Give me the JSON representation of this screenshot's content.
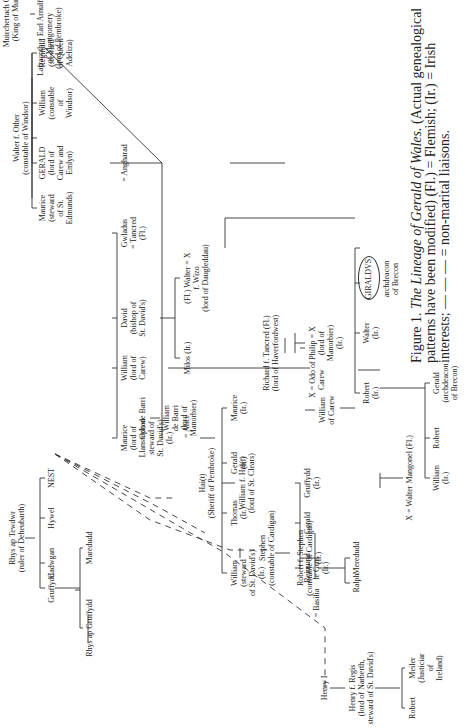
{
  "figure": {
    "caption_label": "Figure 1.",
    "caption_title": "The Lineage of Gerald of Wales.",
    "caption_text": "(Actual genealogical patterns have been modified) (Fl.) = Flemish; (Ir.) = Irish interests; — — — = non-marital liaisons."
  },
  "nodes": {
    "muirchertach": [
      "Muirchertach O Brien",
      "(King of Munster)"
    ],
    "lafracoth": [
      "Lafracoth = Earl Arnulf",
      "of Montgomery",
      "(lord of Pembroke)"
    ],
    "walter_f_other": [
      "Walter f. Other",
      "(constable of Windsor)"
    ],
    "gerald_carew": [
      "GERALD",
      "(lord of",
      "Carew and",
      "Emlyn)"
    ],
    "maurice_edmunds": [
      "Maurice",
      "(steward",
      "of St.",
      "Edmunds)"
    ],
    "william_windsor": [
      "William",
      "(constable",
      "of",
      "Windsor)"
    ],
    "reginald": [
      "Reginald",
      "(steward",
      "of Queen",
      "Adeliza)"
    ],
    "angharad": [
      "= Angharad"
    ],
    "gwladus": [
      "Gwladus",
      "= Tancred",
      "(Fl.)"
    ],
    "david": [
      "David",
      "(bishop of",
      "St. David's)"
    ],
    "william_carew_lord": [
      "William",
      "(lord of",
      "Carew)"
    ],
    "maurice_llanstephan": [
      "Maurice",
      "(lord of",
      "Llanstephan",
      "steward of",
      "St. David's)",
      "(Ir.)"
    ],
    "alice": [
      "= Alice"
    ],
    "walter_wizo": [
      "(Fl.) Walter = X",
      "f. Wizo",
      "(lord of Daugleddau)"
    ],
    "milos": [
      "Milos (Ir.)"
    ],
    "maurice_ir": [
      "Maurice",
      "(Ir.)"
    ],
    "gerald_ir": [
      "Gerald",
      "(Ir.)"
    ],
    "thomas_ir": [
      "Thomas",
      "(Ir.)"
    ],
    "william_steward": [
      "William",
      "(steward",
      "of St. David's)",
      "(Ir.)"
    ],
    "richard_tancred": [
      "Richard f. Tancred (Fl.)",
      "(lord of Haverfordwest)"
    ],
    "philip": [
      "Philip = X",
      "(lord of",
      "Manorbier)",
      "(Ir.)"
    ],
    "x_odo_carew": [
      "X = Odo of",
      "Carew"
    ],
    "william_of_carew": [
      "William",
      "of Carew"
    ],
    "x_walter_mangonel": [
      "X = Walter Mangonel (Fl.)"
    ],
    "gruffydd_ir": [
      "Gruffydd",
      "(Ir.)"
    ],
    "gerald_plain": [
      "Gerald"
    ],
    "reimund": [
      "Reimund",
      "le Gros",
      "(Ir.)"
    ],
    "basilia": [
      "= Basilia"
    ],
    "richard_gilbert": [
      "Richard f. Gilbert"
    ],
    "rhys_ap_tewdwr": [
      "Rhys ap Tewdwr",
      "(ruler of Deheubarth)"
    ],
    "gruffydd": [
      "Gruffydd"
    ],
    "cadwgan": [
      "Cadwgan"
    ],
    "hywel": [
      "Hywel"
    ],
    "nest": [
      "NEST"
    ],
    "maredudd": [
      "Maredudd"
    ],
    "rhys_ap_gruffydd": [
      "Rhys ap Gruffydd"
    ],
    "odo_de_barri": [
      "Odo de Barri"
    ],
    "william_de_barri": [
      "William",
      "de Barri",
      "(lord of",
      "Manorbier)"
    ],
    "hait": [
      "Hai(t)",
      "(Sheriff of Pembroke)"
    ],
    "william_f_hait": [
      "William f. Hai(t)",
      "(lord of St. Clears)"
    ],
    "stephen": [
      "Stephen",
      "(constable of Cardigan)"
    ],
    "robert_f_stephen": [
      "Robert f. Stephen",
      "(constable of Cardigan)",
      "(Ir.)"
    ],
    "ralph": [
      "Ralph"
    ],
    "meredudd": [
      "Meredudd"
    ],
    "henry_i": [
      "Henry I"
    ],
    "henry_f_regis": [
      "Henry f. Regis",
      "(lord of Narberth,",
      "steward of St. David's)"
    ],
    "robert_son": [
      "Robert"
    ],
    "meiler": [
      "Meiler",
      "(Justiciar",
      "of",
      "Ireland)"
    ],
    "robert_ir": [
      "Robert",
      "(Ir.)"
    ],
    "walter_ir": [
      "Walter",
      "(Ir.)"
    ],
    "giraldus": [
      "GIRALDVS"
    ],
    "archdeacon": [
      "archdeacon",
      "of Brecon"
    ],
    "william_ir": [
      "William",
      "(Ir.)"
    ],
    "robert_plain": [
      "Robert"
    ],
    "gerald_archdeacon": [
      "Gerald",
      "(archdeacon",
      "of Brecon)"
    ]
  }
}
